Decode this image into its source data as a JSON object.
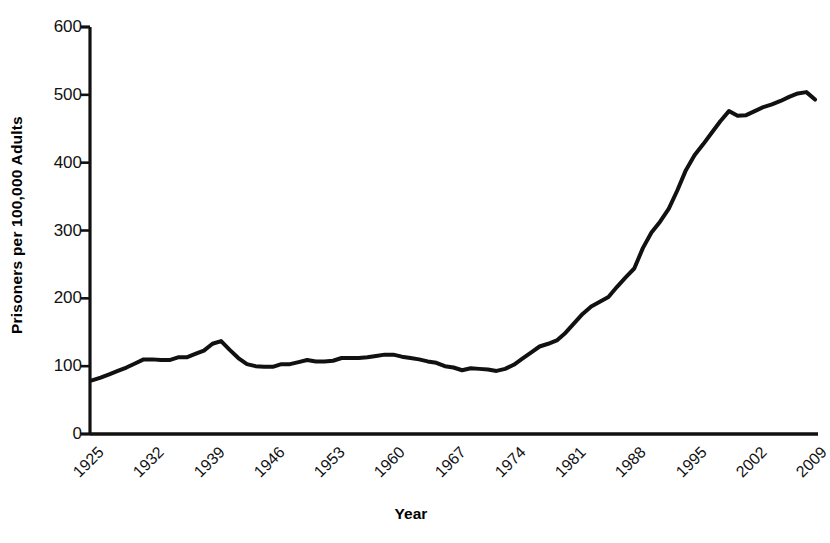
{
  "chart_data": {
    "type": "line",
    "title": "",
    "xlabel": "Year",
    "ylabel": "Prisoners per 100,000 Adults",
    "xlim": [
      1925,
      2009
    ],
    "ylim": [
      0,
      600
    ],
    "ytick_step": 100,
    "xtick_step": 7,
    "grid": false,
    "legend": false,
    "line_color": "#111111",
    "line_width": 4,
    "yticks": [
      600,
      500,
      400,
      300,
      200,
      100,
      0
    ],
    "xticks": [
      1925,
      1932,
      1939,
      1946,
      1953,
      1960,
      1967,
      1974,
      1981,
      1988,
      1995,
      2002,
      2009
    ],
    "series": [
      {
        "name": "Prisoners per 100,000 Adults",
        "x": [
          1925,
          1926,
          1927,
          1928,
          1929,
          1930,
          1931,
          1932,
          1933,
          1934,
          1935,
          1936,
          1937,
          1938,
          1939,
          1940,
          1941,
          1942,
          1943,
          1944,
          1945,
          1946,
          1947,
          1948,
          1949,
          1950,
          1951,
          1952,
          1953,
          1954,
          1955,
          1956,
          1957,
          1958,
          1959,
          1960,
          1961,
          1962,
          1963,
          1964,
          1965,
          1966,
          1967,
          1968,
          1969,
          1970,
          1971,
          1972,
          1973,
          1974,
          1975,
          1976,
          1977,
          1978,
          1979,
          1980,
          1981,
          1982,
          1983,
          1984,
          1985,
          1986,
          1987,
          1988,
          1989,
          1990,
          1991,
          1992,
          1993,
          1994,
          1995,
          1996,
          1997,
          1998,
          1999,
          2000,
          2001,
          2002,
          2003,
          2004,
          2005,
          2006,
          2007,
          2008,
          2009
        ],
        "values": [
          79,
          83,
          88,
          93,
          98,
          104,
          110,
          110,
          109,
          109,
          113,
          113,
          118,
          123,
          133,
          137,
          124,
          112,
          103,
          100,
          99,
          99,
          103,
          103,
          106,
          109,
          107,
          107,
          108,
          112,
          112,
          112,
          113,
          115,
          117,
          117,
          114,
          112,
          110,
          107,
          105,
          100,
          98,
          94,
          97,
          96,
          95,
          93,
          96,
          102,
          111,
          120,
          129,
          133,
          138,
          149,
          163,
          177,
          188,
          195,
          202,
          217,
          231,
          244,
          274,
          297,
          313,
          332,
          359,
          389,
          411,
          427,
          444,
          461,
          476,
          469,
          470,
          476,
          482,
          486,
          491,
          497,
          502,
          504,
          493
        ]
      }
    ]
  },
  "axes": {
    "y_title": "Prisoners per 100,000 Adults",
    "x_title": "Year",
    "y_tick_labels": [
      "600",
      "500",
      "400",
      "300",
      "200",
      "100",
      "0"
    ],
    "x_tick_labels": [
      "1925",
      "1932",
      "1939",
      "1946",
      "1953",
      "1960",
      "1967",
      "1974",
      "1981",
      "1988",
      "1995",
      "2002",
      "2009"
    ]
  }
}
